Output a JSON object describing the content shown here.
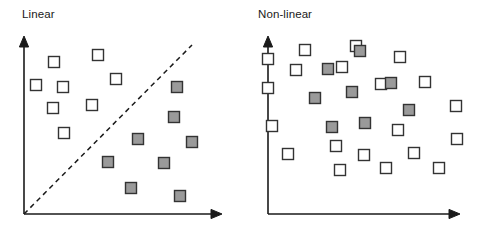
{
  "figure": {
    "background_color": "#ffffff",
    "width": 481,
    "height": 234
  },
  "style": {
    "axis_color": "#1a1a1a",
    "axis_width": 1.6,
    "dash_color": "#1a1a1a",
    "dash_pattern": "5,4",
    "marker_border_color": "#333333",
    "class_a_fill": "#ffffff",
    "class_b_fill": "#9a9a9a",
    "marker_size": 11
  },
  "panels": [
    {
      "id": "linear",
      "title": "Linear",
      "axes": {
        "origin": [
          24,
          214
        ],
        "y_axis_top": [
          24,
          36
        ],
        "x_axis_right": [
          222,
          214
        ],
        "arrow_heads": [
          "up",
          "right"
        ]
      },
      "boundary": {
        "type": "line",
        "label": "linear-decision-boundary",
        "points": [
          [
            24,
            214
          ],
          [
            192,
            45
          ]
        ]
      },
      "class_a_label": "open-square",
      "class_b_label": "filled-square",
      "class_a_points": [
        [
          54,
          62
        ],
        [
          98,
          55
        ],
        [
          36,
          85
        ],
        [
          63,
          87
        ],
        [
          116,
          79
        ],
        [
          53,
          108
        ],
        [
          92,
          105
        ],
        [
          64,
          133
        ]
      ],
      "class_b_points": [
        [
          177,
          87
        ],
        [
          174,
          117
        ],
        [
          138,
          139
        ],
        [
          192,
          142
        ],
        [
          108,
          162
        ],
        [
          164,
          163
        ],
        [
          131,
          188
        ],
        [
          180,
          196
        ]
      ]
    },
    {
      "id": "nonlinear",
      "title": "Non-linear",
      "axes": {
        "origin": [
          28,
          214
        ],
        "y_axis_top": [
          28,
          36
        ],
        "x_axis_right": [
          220,
          214
        ],
        "arrow_heads": [
          "up",
          "right"
        ]
      },
      "boundary": {
        "type": "closed-curve",
        "label": "nonlinear-decision-boundary",
        "points": [
          [
            119,
            23
          ],
          [
            142,
            32
          ],
          [
            168,
            53
          ],
          [
            181,
            77
          ],
          [
            176,
            86
          ],
          [
            130,
            104
          ],
          [
            96,
            111
          ],
          [
            78,
            98
          ],
          [
            76,
            63
          ],
          [
            88,
            36
          ]
        ]
      },
      "class_a_points": [
        [
          28,
          59
        ],
        [
          65,
          50
        ],
        [
          116,
          46
        ],
        [
          56,
          70
        ],
        [
          102,
          67
        ],
        [
          160,
          57
        ],
        [
          28,
          88
        ],
        [
          185,
          82
        ],
        [
          141,
          84
        ],
        [
          32,
          126
        ],
        [
          216,
          106
        ],
        [
          96,
          146
        ],
        [
          48,
          154
        ],
        [
          158,
          130
        ],
        [
          217,
          139
        ],
        [
          100,
          170
        ],
        [
          124,
          155
        ],
        [
          146,
          168
        ],
        [
          174,
          153
        ],
        [
          199,
          168
        ]
      ],
      "class_b_points": [
        [
          120,
          51
        ],
        [
          88,
          69
        ],
        [
          112,
          92
        ],
        [
          151,
          83
        ],
        [
          75,
          98
        ],
        [
          169,
          110
        ],
        [
          92,
          127
        ],
        [
          125,
          123
        ]
      ]
    }
  ],
  "legend": {
    "class_a_name": "unfilled-square-class",
    "class_b_name": "filled-square-class"
  }
}
